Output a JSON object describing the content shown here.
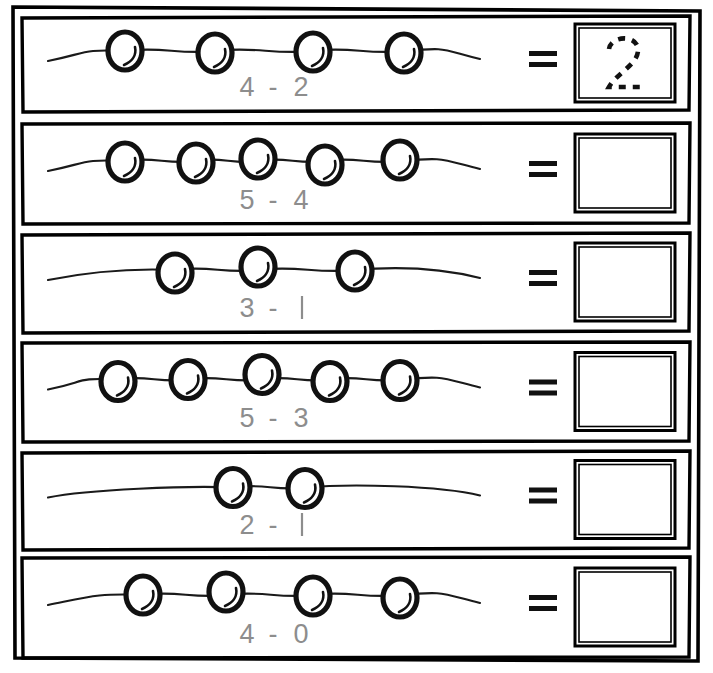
{
  "worksheet": {
    "title": "Subtraction with bead strings",
    "colors": {
      "ink": "#111111",
      "expression_text": "#8d8d8d",
      "paper": "#ffffff"
    },
    "equals_symbol": "=",
    "minus_symbol": "-",
    "rows": [
      {
        "index": 1,
        "beads": 4,
        "minuend": "4",
        "subtrahend": "2",
        "expression": "4 - 2",
        "answer": "2",
        "answer_style": "dashed-trace",
        "answer_filled": true
      },
      {
        "index": 2,
        "beads": 5,
        "minuend": "5",
        "subtrahend": "4",
        "expression": "5 - 4",
        "answer": "",
        "answer_style": "empty",
        "answer_filled": false
      },
      {
        "index": 3,
        "beads": 3,
        "minuend": "3",
        "subtrahend": "1",
        "expression": "3 - 1",
        "answer": "",
        "answer_style": "empty",
        "answer_filled": false
      },
      {
        "index": 4,
        "beads": 5,
        "minuend": "5",
        "subtrahend": "3",
        "expression": "5 - 3",
        "answer": "",
        "answer_style": "empty",
        "answer_filled": false
      },
      {
        "index": 5,
        "beads": 2,
        "minuend": "2",
        "subtrahend": "1",
        "expression": "2 - 1",
        "answer": "",
        "answer_style": "empty",
        "answer_filled": false
      },
      {
        "index": 6,
        "beads": 4,
        "minuend": "4",
        "subtrahend": "0",
        "expression": "4 - 0",
        "answer": "",
        "answer_style": "empty",
        "answer_filled": false
      }
    ]
  }
}
